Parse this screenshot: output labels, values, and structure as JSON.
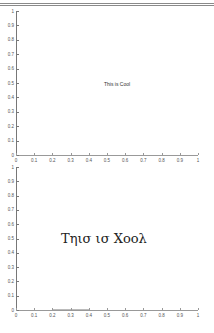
{
  "chart_data": [
    {
      "type": "line",
      "title": "",
      "xlabel": "",
      "ylabel": "",
      "xlim": [
        0,
        1
      ],
      "ylim": [
        0,
        1
      ],
      "xticks": [
        "0",
        "0.1",
        "0.2",
        "0.3",
        "0.4",
        "0.5",
        "0.6",
        "0.7",
        "0.8",
        "0.9",
        "1"
      ],
      "yticks": [
        "0",
        "0.1",
        "0.2",
        "0.3",
        "0.4",
        "0.5",
        "0.6",
        "0.7",
        "0.8",
        "0.9",
        "1"
      ],
      "grid": false,
      "series": [],
      "annotations": [
        {
          "text": "This is Cool",
          "x": 0.5,
          "y": 0.5,
          "font": "sans-serif",
          "size": "small"
        }
      ]
    },
    {
      "type": "line",
      "title": "",
      "xlabel": "",
      "ylabel": "",
      "xlim": [
        0,
        1
      ],
      "ylim": [
        0,
        1
      ],
      "xticks": [
        "0",
        "0.1",
        "0.2",
        "0.3",
        "0.4",
        "0.5",
        "0.6",
        "0.7",
        "0.8",
        "0.9",
        "1"
      ],
      "yticks": [
        "0",
        "0.1",
        "0.2",
        "0.3",
        "0.4",
        "0.5",
        "0.6",
        "0.7",
        "0.8",
        "0.9",
        "1"
      ],
      "grid": false,
      "series": [
        {
          "name": "faint-line",
          "x": [
            0.2,
            0.4
          ],
          "y": [
            0,
            0
          ]
        }
      ],
      "annotations": [
        {
          "text": "Τηισ ισ Χοολ",
          "x": 0.25,
          "y": 0.5,
          "font": "serif (symbol)",
          "size": "large"
        }
      ]
    }
  ],
  "plots": {
    "top": {
      "annotation": "This is Cool",
      "xticks": [
        "0",
        "0.1",
        "0.2",
        "0.3",
        "0.4",
        "0.5",
        "0.6",
        "0.7",
        "0.8",
        "0.9",
        "1"
      ],
      "yticks": [
        "0",
        "0.1",
        "0.2",
        "0.3",
        "0.4",
        "0.5",
        "0.6",
        "0.7",
        "0.8",
        "0.9",
        "1"
      ]
    },
    "bottom": {
      "annotation": "Τηισ ισ Χοολ",
      "xticks": [
        "0",
        "0.1",
        "0.2",
        "0.3",
        "0.4",
        "0.5",
        "0.6",
        "0.7",
        "0.8",
        "0.9",
        "1"
      ],
      "yticks": [
        "0",
        "0.1",
        "0.2",
        "0.3",
        "0.4",
        "0.5",
        "0.6",
        "0.7",
        "0.8",
        "0.9",
        "1"
      ]
    }
  }
}
